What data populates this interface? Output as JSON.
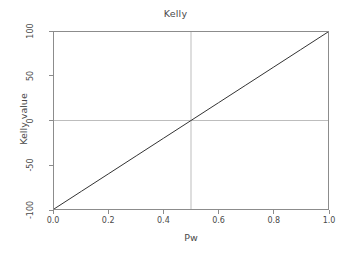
{
  "chart_data": {
    "type": "line",
    "title": "Kelly",
    "xlabel": "Pw",
    "ylabel": "Kelly value",
    "xlim": [
      0.0,
      1.0
    ],
    "ylim": [
      -100,
      100
    ],
    "grid": false,
    "legend": null,
    "series": [
      {
        "name": "Kelly value",
        "color": "#333333",
        "x": [
          0.0,
          0.1,
          0.2,
          0.3,
          0.4,
          0.5,
          0.6,
          0.7,
          0.8,
          0.9,
          1.0
        ],
        "values": [
          -100,
          -80,
          -60,
          -40,
          -20,
          0,
          20,
          40,
          60,
          80,
          100
        ]
      }
    ],
    "reference_lines": [
      {
        "name": "vertical-reference-line",
        "orientation": "vertical",
        "value": 0.5,
        "color": "#bdbdbd"
      },
      {
        "name": "horizontal-reference-line",
        "orientation": "horizontal",
        "value": 0,
        "color": "#bdbdbd"
      }
    ],
    "xticks": [
      {
        "value": 0.0,
        "label": "0.0"
      },
      {
        "value": 0.2,
        "label": "0.2"
      },
      {
        "value": 0.4,
        "label": "0.4"
      },
      {
        "value": 0.6,
        "label": "0.6"
      },
      {
        "value": 0.8,
        "label": "0.8"
      },
      {
        "value": 1.0,
        "label": "1.0"
      }
    ],
    "yticks": [
      {
        "value": 100,
        "label": "100"
      },
      {
        "value": 50,
        "label": "50"
      },
      {
        "value": 0,
        "label": "0"
      },
      {
        "value": -50,
        "label": "-50"
      },
      {
        "value": -100,
        "label": "-100"
      }
    ],
    "colors": {
      "background": "#ffffff",
      "frame": "#8c8c8c",
      "text": "#4a4a4a",
      "line": "#333333",
      "reference": "#bdbdbd"
    }
  }
}
